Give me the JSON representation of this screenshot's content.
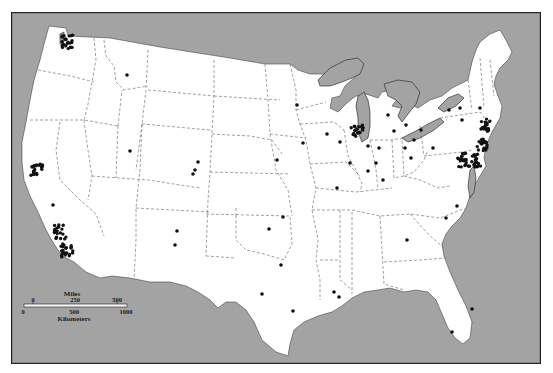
{
  "map": {
    "title": "",
    "colors": {
      "water": "#a3a3a3",
      "land": "#ffffff",
      "lakes": "#a3a3a3",
      "border": "#222222",
      "state_lines": "#666666",
      "dots": "#111111"
    },
    "scale_bar": {
      "miles_label": "Miles",
      "miles_ticks": [
        "0",
        "250",
        "500"
      ],
      "km_label": "Kilometers",
      "km_ticks": [
        "0",
        "500",
        "1000"
      ]
    },
    "dots": [
      {
        "x": 67,
        "y": 42,
        "cluster": true,
        "label": "seattle"
      },
      {
        "x": 127,
        "y": 75,
        "label": "montana"
      },
      {
        "x": 37,
        "y": 170,
        "cluster": true,
        "label": "bay-area"
      },
      {
        "x": 53,
        "y": 205,
        "label": "central-ca"
      },
      {
        "x": 60,
        "y": 232,
        "cluster": true,
        "label": "los-angeles"
      },
      {
        "x": 67,
        "y": 250,
        "cluster": true,
        "label": "san-diego"
      },
      {
        "x": 130,
        "y": 151,
        "label": "utah"
      },
      {
        "x": 198,
        "y": 162,
        "label": "colorado-n"
      },
      {
        "x": 195,
        "y": 170,
        "label": "colorado"
      },
      {
        "x": 193,
        "y": 174,
        "label": "colorado-s"
      },
      {
        "x": 177,
        "y": 231,
        "label": "nm-n"
      },
      {
        "x": 175,
        "y": 245,
        "label": "nm-s"
      },
      {
        "x": 297,
        "y": 105,
        "label": "minneapolis"
      },
      {
        "x": 303,
        "y": 143,
        "label": "iowa"
      },
      {
        "x": 327,
        "y": 134,
        "label": "wisconsin"
      },
      {
        "x": 277,
        "y": 160,
        "label": "nebraska"
      },
      {
        "x": 337,
        "y": 188,
        "label": "st-louis"
      },
      {
        "x": 283,
        "y": 217,
        "label": "oklahoma-n"
      },
      {
        "x": 269,
        "y": 229,
        "label": "oklahoma"
      },
      {
        "x": 281,
        "y": 265,
        "label": "texas-n"
      },
      {
        "x": 262,
        "y": 294,
        "label": "texas-c"
      },
      {
        "x": 293,
        "y": 311,
        "label": "houston"
      },
      {
        "x": 334,
        "y": 292,
        "label": "louisiana"
      },
      {
        "x": 339,
        "y": 297,
        "label": "new-orleans"
      },
      {
        "x": 357,
        "y": 132,
        "cluster": true,
        "label": "chicago"
      },
      {
        "x": 340,
        "y": 142,
        "label": "illinois"
      },
      {
        "x": 350,
        "y": 163,
        "label": "illinois-c"
      },
      {
        "x": 368,
        "y": 146,
        "label": "indiana-n"
      },
      {
        "x": 379,
        "y": 148,
        "label": "indiana"
      },
      {
        "x": 376,
        "y": 163,
        "label": "indianapolis"
      },
      {
        "x": 368,
        "y": 171,
        "label": "indiana-s"
      },
      {
        "x": 383,
        "y": 180,
        "label": "kentucky"
      },
      {
        "x": 388,
        "y": 115,
        "label": "michigan"
      },
      {
        "x": 394,
        "y": 131,
        "label": "michigan-s"
      },
      {
        "x": 405,
        "y": 148,
        "label": "ohio"
      },
      {
        "x": 411,
        "y": 158,
        "label": "ohio-c"
      },
      {
        "x": 414,
        "y": 140,
        "label": "toledo"
      },
      {
        "x": 406,
        "y": 125,
        "label": "detroit"
      },
      {
        "x": 421,
        "y": 130,
        "label": "cleveland"
      },
      {
        "x": 433,
        "y": 148,
        "label": "pennsylvania-w"
      },
      {
        "x": 449,
        "y": 110,
        "label": "ny-w"
      },
      {
        "x": 460,
        "y": 108,
        "label": "ny"
      },
      {
        "x": 462,
        "y": 120,
        "label": "ny-c"
      },
      {
        "x": 480,
        "y": 108,
        "label": "ny-e"
      },
      {
        "x": 485,
        "y": 125,
        "cluster": true,
        "label": "boston"
      },
      {
        "x": 483,
        "y": 145,
        "cluster": true,
        "label": "nyc"
      },
      {
        "x": 475,
        "y": 160,
        "cluster": true,
        "label": "philadelphia"
      },
      {
        "x": 463,
        "y": 160,
        "cluster": true,
        "label": "baltimore-dc"
      },
      {
        "x": 457,
        "y": 206,
        "label": "north-carolina"
      },
      {
        "x": 407,
        "y": 240,
        "label": "georgia"
      },
      {
        "x": 452,
        "y": 332,
        "label": "tampa"
      },
      {
        "x": 472,
        "y": 309,
        "label": "florida-east"
      },
      {
        "x": 446,
        "y": 218,
        "label": "raleigh"
      }
    ]
  }
}
